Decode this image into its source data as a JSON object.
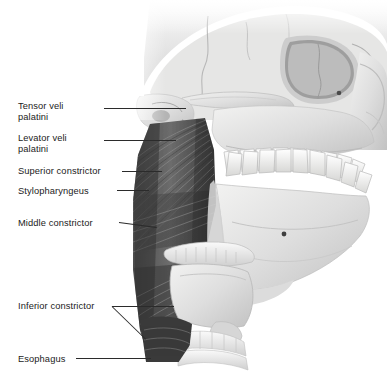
{
  "figure": {
    "kind": "anatomical-illustration",
    "style": "grayscale medical illustration",
    "background_color": "#ffffff",
    "label_color": "#1b1b1b",
    "leader_color": "#2b2b2b",
    "width": 387,
    "height": 373
  },
  "labels": [
    {
      "id": "tensor-veli-palatini",
      "line1": "Tensor veli",
      "line2": "palatini",
      "x": 18,
      "y": 101
    },
    {
      "id": "levator-veli-palatini",
      "line1": "Levator veli",
      "line2": "palatini",
      "x": 18,
      "y": 133
    },
    {
      "id": "superior-constrictor",
      "line1": "Superior constrictor",
      "line2": "",
      "x": 18,
      "y": 166
    },
    {
      "id": "stylopharyngeus",
      "line1": "Stylopharyngeus",
      "line2": "",
      "x": 18,
      "y": 186
    },
    {
      "id": "middle-constrictor",
      "line1": "Middle constrictor",
      "line2": "",
      "x": 18,
      "y": 218
    },
    {
      "id": "inferior-constrictor",
      "line1": "Inferior constrictor",
      "line2": "",
      "x": 18,
      "y": 301
    },
    {
      "id": "esophagus",
      "line1": "Esophagus",
      "line2": "",
      "x": 18,
      "y": 354
    }
  ],
  "leaders": [
    {
      "id": "leader-tensor-veli-palatini",
      "x1": 104,
      "y1": 108,
      "x2": 186,
      "y2": 108
    },
    {
      "id": "leader-levator-veli-palatini",
      "x1": 104,
      "y1": 140,
      "x2": 176,
      "y2": 140
    },
    {
      "id": "leader-superior-constrictor",
      "x1": 122,
      "y1": 171,
      "x2": 162,
      "y2": 171
    },
    {
      "id": "leader-stylopharyngeus",
      "x1": 117,
      "y1": 190,
      "x2": 149,
      "y2": 190
    },
    {
      "id": "leader-middle-constrictor",
      "x1": 119,
      "y1": 222,
      "x2": 157,
      "y2": 227
    },
    {
      "id": "leader-inferior-constrictor-upper",
      "x1": 112,
      "y1": 306,
      "x2": 174,
      "y2": 306
    },
    {
      "id": "leader-inferior-constrictor-lower",
      "x1": 112,
      "y1": 306,
      "x2": 146,
      "y2": 339
    },
    {
      "id": "leader-esophagus",
      "x1": 76,
      "y1": 358,
      "x2": 151,
      "y2": 358
    }
  ],
  "structures": [
    {
      "id": "cranium",
      "name": "cranial vault"
    },
    {
      "id": "orbit",
      "name": "orbital cavity"
    },
    {
      "id": "zygomatic-arch",
      "name": "zygomatic arch"
    },
    {
      "id": "nasal-bones",
      "name": "nasal region"
    },
    {
      "id": "maxilla",
      "name": "maxilla with upper dental arch"
    },
    {
      "id": "mandible",
      "name": "mandible with lower dental arch"
    },
    {
      "id": "mental-foramen",
      "name": "mental foramen"
    },
    {
      "id": "styloid-process",
      "name": "styloid process"
    },
    {
      "id": "pharyngeal-muscles",
      "name": "pharyngeal constrictor muscle mass"
    },
    {
      "id": "hyoid-bone",
      "name": "hyoid bone"
    },
    {
      "id": "thyroid-cartilage",
      "name": "thyroid cartilage"
    },
    {
      "id": "cricoid-cartilage",
      "name": "cricoid cartilage"
    },
    {
      "id": "trachea",
      "name": "tracheal rings"
    },
    {
      "id": "esophagus-structure",
      "name": "esophagus"
    }
  ]
}
